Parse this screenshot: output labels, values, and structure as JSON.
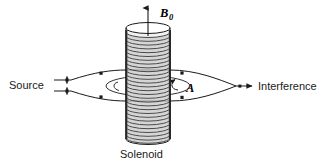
{
  "figure": {
    "kind": "aharonov-bohm-interference-diagram",
    "background_color": "#ffffff",
    "line_color": "#1a1a1a",
    "coil_fill_color": "#d9d9d9",
    "coil_stroke_color": "#333333",
    "labels": {
      "source": "Source",
      "interference": "Interference",
      "solenoid": "Solenoid",
      "field": "B",
      "field_subscript": "0",
      "potential": "A"
    },
    "solenoid": {
      "left_x": 126,
      "right_x": 170,
      "top_y": 28,
      "bottom_y": 139,
      "turns": 29,
      "ellipse_ry": 5.5
    },
    "field_arrow": {
      "from_y": 36,
      "to_y": 6,
      "x": 148
    },
    "beam": {
      "source_slit_x": 71,
      "upper_y": 80,
      "lower_y": 91,
      "split_x": 71,
      "merge_x": 236,
      "apex_top_y": 70,
      "apex_bottom_y": 101,
      "arrow_tip_x": 252
    },
    "potential_loop": {
      "cx": 148,
      "cy": 86,
      "rx": 42,
      "ry": 10
    },
    "markers": [
      {
        "x": 67,
        "y": 80
      },
      {
        "x": 67,
        "y": 91
      },
      {
        "x": 101,
        "y": 74
      },
      {
        "x": 101,
        "y": 97
      },
      {
        "x": 182,
        "y": 74
      },
      {
        "x": 182,
        "y": 97
      },
      {
        "x": 240,
        "y": 86
      }
    ]
  }
}
